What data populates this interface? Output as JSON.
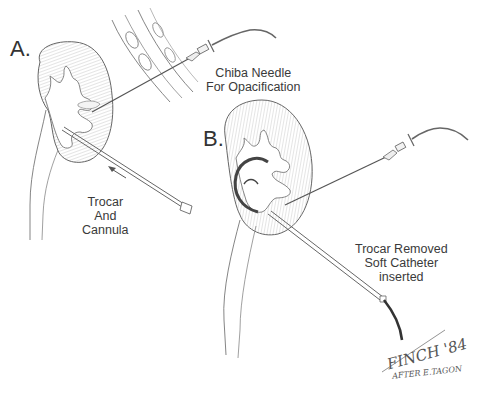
{
  "figure": {
    "panel_a": {
      "letter": "A.",
      "needle_caption": [
        "Chiba Needle",
        "For Opacification"
      ],
      "trocar_caption": [
        "Trocar",
        "And",
        "Cannula"
      ]
    },
    "panel_b": {
      "letter": "B.",
      "caption": [
        "Trocar Removed",
        "Soft Catheter",
        "inserted"
      ]
    },
    "signature": {
      "artist": "FINCH '84",
      "credit": "AFTER E.TAGON"
    },
    "colors": {
      "line": "#555555",
      "shade": "#9a9a9a",
      "background": "#ffffff"
    }
  }
}
